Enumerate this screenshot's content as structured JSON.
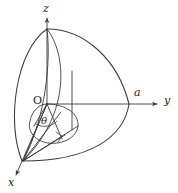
{
  "figure": {
    "kind": "3d-coordinate-diagram",
    "stroke_color": "#3a3a3a",
    "background_color": "#ffffff",
    "axes": [
      {
        "id": "z",
        "label": "z",
        "direction": "up"
      },
      {
        "id": "y",
        "label": "y",
        "direction": "right"
      },
      {
        "id": "x",
        "label": "x",
        "direction": "down-left"
      }
    ],
    "points": [
      {
        "id": "origin",
        "label": "O"
      },
      {
        "id": "radius-on-y",
        "label": "a"
      }
    ],
    "angles": [
      {
        "id": "theta",
        "label": "θ"
      }
    ],
    "markers": [
      {
        "id": "right-angle",
        "label": ""
      }
    ],
    "icons": {
      "z_axis_arrow": "arrow-up-icon",
      "y_axis_arrow": "arrow-right-icon",
      "x_axis_arrow": "arrow-down-left-icon"
    }
  }
}
